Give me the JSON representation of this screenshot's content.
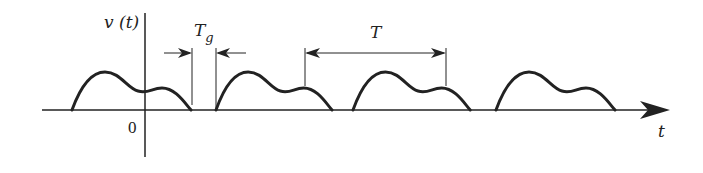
{
  "diagram": {
    "type": "periodic-pulse-train-with-guard-time",
    "labels": {
      "y_axis": "v (t)",
      "x_axis": "t",
      "origin": "0",
      "guard_time_main": "T",
      "guard_time_sub": "g",
      "period": "T"
    },
    "colors": {
      "stroke": "#222222",
      "background": "#ffffff"
    },
    "pulse_count": 4,
    "annotations": [
      {
        "name": "guard-time",
        "description": "Tg gap between consecutive pulses, indicated by inward-pointing arrows"
      },
      {
        "name": "period",
        "description": "T, pulse repetition period, indicated by a double-headed arrow"
      }
    ]
  }
}
